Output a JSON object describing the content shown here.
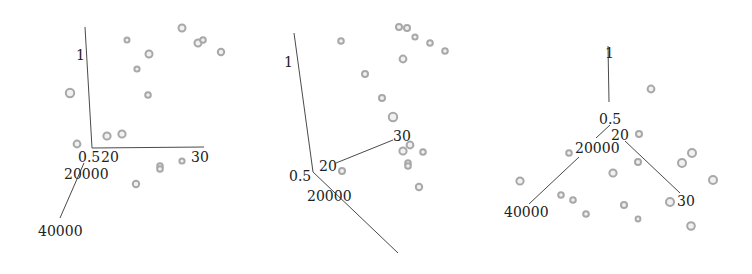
{
  "chart_data": {
    "type": "scatter3d",
    "title": "",
    "axes": {
      "x": {
        "label": "",
        "ticks": [
          "20",
          "30"
        ],
        "range": [
          20,
          30
        ]
      },
      "y": {
        "label": "",
        "ticks": [
          "20000",
          "40000"
        ],
        "range": [
          20000,
          40000
        ]
      },
      "z": {
        "label": "",
        "ticks": [
          "0.5",
          "1"
        ],
        "range": [
          0.5,
          1
        ]
      }
    },
    "grid": false,
    "legend": null,
    "colors": {
      "axis": "#4a4a4a",
      "point_stroke": "#a8a8a8",
      "point_fill": "#f1f1f1",
      "label": "#222222"
    },
    "panels": [
      {
        "name": "view-1",
        "axes_lines": [
          {
            "name": "z-axis",
            "x1": 85,
            "y1": 27,
            "x2": 92,
            "y2": 148
          },
          {
            "name": "x-axis",
            "x1": 92,
            "y1": 148,
            "x2": 204,
            "y2": 147
          },
          {
            "name": "y-axis",
            "x1": 84,
            "y1": 163,
            "x2": 60,
            "y2": 218
          }
        ],
        "labels": [
          {
            "name": "z-tick-1",
            "text": "1",
            "x": 76,
            "y": 60
          },
          {
            "name": "z-tick-0.5",
            "text": "0.5",
            "x": 78,
            "y": 162
          },
          {
            "name": "x-tick-20",
            "text": "20",
            "x": 101,
            "y": 162
          },
          {
            "name": "x-tick-30",
            "text": "30",
            "x": 191,
            "y": 162
          },
          {
            "name": "y-tick-20000",
            "text": "20000",
            "x": 64,
            "y": 179
          },
          {
            "name": "y-tick-40000",
            "text": "40000",
            "x": 38,
            "y": 236
          }
        ],
        "points": [
          {
            "x": 182,
            "y": 28,
            "r": 3.5
          },
          {
            "x": 127,
            "y": 40,
            "r": 2.5
          },
          {
            "x": 198,
            "y": 43,
            "r": 3.5
          },
          {
            "x": 203,
            "y": 40,
            "r": 2.8
          },
          {
            "x": 221,
            "y": 52,
            "r": 3.2
          },
          {
            "x": 149,
            "y": 54,
            "r": 3.5
          },
          {
            "x": 137,
            "y": 69,
            "r": 2.6
          },
          {
            "x": 70,
            "y": 93,
            "r": 4.2
          },
          {
            "x": 148,
            "y": 95,
            "r": 2.8
          },
          {
            "x": 107,
            "y": 136,
            "r": 3.6
          },
          {
            "x": 122,
            "y": 134,
            "r": 3.6
          },
          {
            "x": 77,
            "y": 144,
            "r": 3.4
          },
          {
            "x": 160,
            "y": 166,
            "r": 2.8
          },
          {
            "x": 160,
            "y": 169,
            "r": 2.8
          },
          {
            "x": 182,
            "y": 161,
            "r": 2.6
          },
          {
            "x": 136,
            "y": 184,
            "r": 3.2
          }
        ]
      },
      {
        "name": "view-2",
        "axes_lines": [
          {
            "name": "z-axis",
            "x1": 294,
            "y1": 33,
            "x2": 313,
            "y2": 172
          },
          {
            "name": "x-axis",
            "x1": 336,
            "y1": 163,
            "x2": 393,
            "y2": 140
          },
          {
            "name": "y-axis",
            "x1": 313,
            "y1": 172,
            "x2": 398,
            "y2": 253
          }
        ],
        "labels": [
          {
            "name": "z-tick-1",
            "text": "1",
            "x": 284,
            "y": 67
          },
          {
            "name": "z-tick-0.5",
            "text": "0.5",
            "x": 289,
            "y": 181
          },
          {
            "name": "x-tick-20",
            "text": "20",
            "x": 319,
            "y": 171
          },
          {
            "name": "x-tick-30",
            "text": "30",
            "x": 393,
            "y": 141
          },
          {
            "name": "y-tick-20000",
            "text": "20000",
            "x": 307,
            "y": 201
          }
        ],
        "points": [
          {
            "x": 399,
            "y": 27,
            "r": 3.0
          },
          {
            "x": 407,
            "y": 28,
            "r": 3.0
          },
          {
            "x": 415,
            "y": 37,
            "r": 2.6
          },
          {
            "x": 430,
            "y": 43,
            "r": 2.8
          },
          {
            "x": 445,
            "y": 51,
            "r": 2.8
          },
          {
            "x": 341,
            "y": 41,
            "r": 2.8
          },
          {
            "x": 403,
            "y": 59,
            "r": 3.4
          },
          {
            "x": 365,
            "y": 74,
            "r": 3.0
          },
          {
            "x": 382,
            "y": 98,
            "r": 3.0
          },
          {
            "x": 393,
            "y": 117,
            "r": 4.2
          },
          {
            "x": 410,
            "y": 145,
            "r": 3.4
          },
          {
            "x": 403,
            "y": 151,
            "r": 3.6
          },
          {
            "x": 423,
            "y": 152,
            "r": 2.8
          },
          {
            "x": 408,
            "y": 163,
            "r": 2.8
          },
          {
            "x": 408,
            "y": 166,
            "r": 2.8
          },
          {
            "x": 419,
            "y": 187,
            "r": 3.2
          },
          {
            "x": 342,
            "y": 171,
            "r": 3.0
          }
        ]
      },
      {
        "name": "view-3",
        "axes_lines": [
          {
            "name": "z-axis",
            "x1": 608,
            "y1": 46,
            "x2": 609,
            "y2": 102
          },
          {
            "name": "x-axis",
            "x1": 625,
            "y1": 141,
            "x2": 680,
            "y2": 193
          },
          {
            "name": "y-axis",
            "x1": 579,
            "y1": 157,
            "x2": 529,
            "y2": 204
          },
          {
            "name": "origin-link",
            "x1": 610,
            "y1": 125,
            "x2": 596,
            "y2": 138
          }
        ],
        "labels": [
          {
            "name": "z-tick-1",
            "text": "1",
            "x": 605,
            "y": 58
          },
          {
            "name": "z-tick-0.5",
            "text": "0.5",
            "x": 599,
            "y": 124
          },
          {
            "name": "x-tick-20",
            "text": "20",
            "x": 611,
            "y": 140
          },
          {
            "name": "x-tick-30",
            "text": "30",
            "x": 677,
            "y": 206
          },
          {
            "name": "y-tick-20000",
            "text": "20000",
            "x": 575,
            "y": 153
          },
          {
            "name": "y-tick-40000",
            "text": "40000",
            "x": 504,
            "y": 217
          }
        ],
        "points": [
          {
            "x": 651,
            "y": 89,
            "r": 3.4
          },
          {
            "x": 639,
            "y": 134,
            "r": 3.0
          },
          {
            "x": 692,
            "y": 153,
            "r": 4.0
          },
          {
            "x": 682,
            "y": 163,
            "r": 4.0
          },
          {
            "x": 569,
            "y": 153,
            "r": 2.8
          },
          {
            "x": 638,
            "y": 162,
            "r": 3.0
          },
          {
            "x": 713,
            "y": 180,
            "r": 4.0
          },
          {
            "x": 613,
            "y": 173,
            "r": 3.6
          },
          {
            "x": 520,
            "y": 181,
            "r": 3.6
          },
          {
            "x": 561,
            "y": 195,
            "r": 2.8
          },
          {
            "x": 573,
            "y": 200,
            "r": 2.8
          },
          {
            "x": 586,
            "y": 214,
            "r": 2.8
          },
          {
            "x": 624,
            "y": 205,
            "r": 3.0
          },
          {
            "x": 670,
            "y": 202,
            "r": 4.0
          },
          {
            "x": 638,
            "y": 219,
            "r": 2.4
          },
          {
            "x": 691,
            "y": 226,
            "r": 3.8
          }
        ]
      }
    ]
  }
}
